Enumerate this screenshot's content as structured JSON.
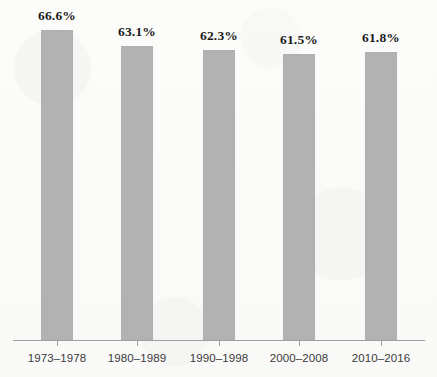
{
  "chart_data": {
    "type": "bar",
    "title": "",
    "subtitle": "",
    "xlabel": "",
    "ylabel": "",
    "categories": [
      "1973–1978",
      "1980–1989",
      "1990–1998",
      "2000–2008",
      "2010–2016"
    ],
    "values": [
      66.6,
      63.1,
      62.3,
      61.5,
      61.8
    ],
    "value_labels": [
      "66.6%",
      "63.1%",
      "62.3%",
      "61.5%",
      "61.8%"
    ],
    "ylim": [
      0,
      73
    ],
    "grid": false,
    "legend": null,
    "legend_position": "none",
    "annotations": [],
    "series": [
      {
        "name": "",
        "values": [
          66.6,
          63.1,
          62.3,
          61.5,
          61.8
        ]
      }
    ]
  },
  "style": {
    "bar_color": "#b2b2b2",
    "background_color": "#fbfbfa",
    "axis_color": "#a0a0a0",
    "label_color": "#1b1b1b",
    "tick_label_color": "#3a3a3a"
  },
  "axis": {
    "tick_count": 5
  }
}
